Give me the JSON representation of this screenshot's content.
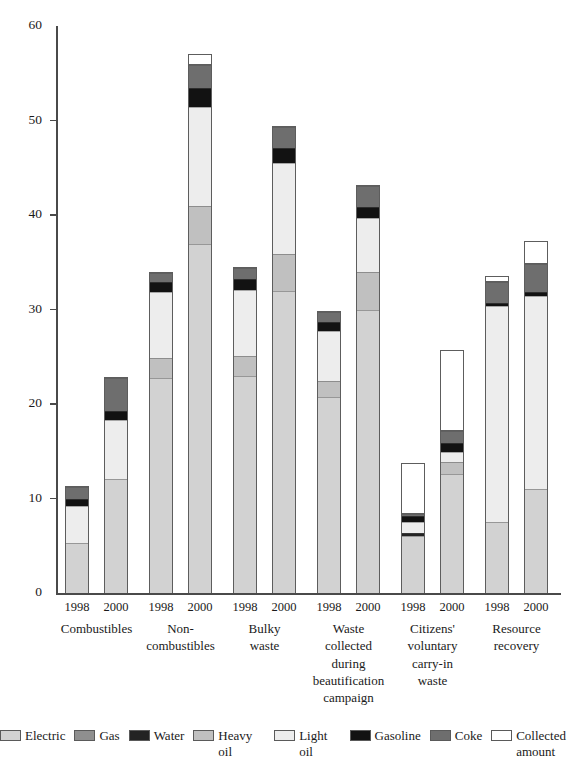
{
  "chart_data": {
    "type": "bar",
    "subtype": "stacked-bar",
    "title": "",
    "xlabel": "",
    "ylabel": "",
    "ylim": [
      0,
      60
    ],
    "yticks": [
      0,
      10,
      20,
      30,
      40,
      50,
      60
    ],
    "grid": false,
    "legend_position": "bottom",
    "categories": [
      "Combustibles 1998",
      "Combustibles 2000",
      "Non-combustibles 1998",
      "Non-combustibles 2000",
      "Bulky waste 1998",
      "Bulky waste 2000",
      "Waste collected during beautification campaign 1998",
      "Waste collected during beautification campaign 2000",
      "Citizens' voluntary carry-in waste 1998",
      "Citizens' voluntary carry-in waste 2000",
      "Resource recovery 1998",
      "Resource recovery 2000"
    ],
    "series": [
      {
        "name": "Electric",
        "color": "#d2d2d2",
        "values": [
          5.3,
          12.1,
          22.8,
          37.0,
          23.0,
          32.0,
          20.8,
          30.0,
          6.3,
          12.7,
          7.5,
          11.0
        ]
      },
      {
        "name": "Gas",
        "color": "#8f8f8f",
        "values": [
          0.0,
          0.0,
          0.0,
          0.0,
          0.0,
          0.0,
          0.0,
          0.0,
          0.0,
          0.0,
          0.0,
          0.0
        ]
      },
      {
        "name": "Water",
        "color": "#232323",
        "values": [
          0.0,
          0.0,
          0.0,
          0.0,
          0.0,
          0.0,
          0.0,
          0.0,
          0.4,
          0.0,
          0.0,
          0.0
        ]
      },
      {
        "name": "Heavy oil",
        "color": "#c0c0c0",
        "values": [
          0.0,
          0.0,
          2.1,
          4.0,
          2.2,
          4.0,
          1.7,
          4.0,
          0.0,
          1.3,
          0.0,
          0.0
        ]
      },
      {
        "name": "Light oil",
        "color": "#ededed",
        "values": [
          4.0,
          6.3,
          7.0,
          10.5,
          7.0,
          9.6,
          5.3,
          5.8,
          1.2,
          1.0,
          23.0,
          20.5
        ]
      },
      {
        "name": "Gasoline",
        "color": "#121212",
        "values": [
          0.7,
          0.9,
          1.1,
          2.0,
          1.1,
          1.6,
          1.0,
          1.1,
          0.6,
          1.0,
          0.3,
          0.5
        ]
      },
      {
        "name": "Coke",
        "color": "#6e6e6e",
        "values": [
          1.3,
          3.6,
          1.0,
          2.5,
          1.2,
          2.2,
          1.0,
          2.3,
          0.3,
          1.3,
          2.2,
          2.9
        ]
      },
      {
        "name": "Collected amount",
        "color": "#ffffff",
        "values": [
          0.0,
          0.0,
          0.0,
          0.0,
          0.0,
          0.0,
          0.0,
          0.0,
          5.3,
          8.5,
          0.0,
          0.0
        ]
      }
    ],
    "bar_totals": [
      11.3,
      22.9,
      34.0,
      56.0,
      34.5,
      49.4,
      29.8,
      43.2,
      8.5,
      17.3,
      33.0,
      34.9
    ],
    "outline_totals": [
      11.3,
      22.9,
      34.0,
      57.0,
      34.5,
      49.4,
      29.8,
      43.2,
      13.8,
      25.7,
      33.5,
      37.3
    ]
  },
  "axis": {
    "y_ticks": [
      {
        "value": 60,
        "label": "60"
      },
      {
        "value": 50,
        "label": "50"
      },
      {
        "value": 40,
        "label": "40"
      },
      {
        "value": 30,
        "label": "30"
      },
      {
        "value": 20,
        "label": "20"
      },
      {
        "value": 10,
        "label": "10"
      },
      {
        "value": 0,
        "label": "0"
      }
    ]
  },
  "groups": [
    {
      "label": "Combustibles",
      "years": [
        "1998",
        "2000"
      ]
    },
    {
      "label": "Non-\ncombustibles",
      "years": [
        "1998",
        "2000"
      ]
    },
    {
      "label": "Bulky\nwaste",
      "years": [
        "1998",
        "2000"
      ]
    },
    {
      "label": "Waste\ncollected\nduring\nbeautification\ncampaign",
      "years": [
        "1998",
        "2000"
      ]
    },
    {
      "label": "Citizens'\nvoluntary\ncarry-in\nwaste",
      "years": [
        "1998",
        "2000"
      ]
    },
    {
      "label": "Resource\nrecovery",
      "years": [
        "1998",
        "2000"
      ]
    }
  ],
  "legend": {
    "items": [
      {
        "label": "Electric",
        "color": "#d2d2d2"
      },
      {
        "label": "Gas",
        "color": "#8f8f8f"
      },
      {
        "label": "Water",
        "color": "#232323"
      },
      {
        "label": "Heavy oil",
        "color": "#c0c0c0"
      },
      {
        "label": "Light oil",
        "color": "#ededed"
      },
      {
        "label": "Gasoline",
        "color": "#121212"
      },
      {
        "label": "Coke",
        "color": "#6e6e6e"
      },
      {
        "label": "Collected\namount",
        "color": "#ffffff"
      }
    ]
  }
}
